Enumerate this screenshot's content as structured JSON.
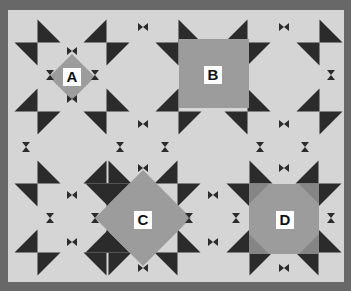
{
  "figure": {
    "colors": {
      "frame": "#686868",
      "background": "#d5d5d5",
      "triangle": "#2b2b2b",
      "shape_fill": "#9c9c9c",
      "shape_corner": "#858585",
      "label_bg": "#ffffff",
      "label_text": "#111111"
    },
    "shapes": [
      {
        "id": "A",
        "label": "A",
        "kind": "small-diamond"
      },
      {
        "id": "B",
        "label": "B",
        "kind": "square"
      },
      {
        "id": "C",
        "label": "C",
        "kind": "large-diamond"
      },
      {
        "id": "D",
        "label": "D",
        "kind": "octagon"
      }
    ],
    "icons": {
      "triangle": "star-point-triangle-icon",
      "bowtie": "bowtie-icon",
      "hourglass": "hourglass-icon"
    }
  }
}
